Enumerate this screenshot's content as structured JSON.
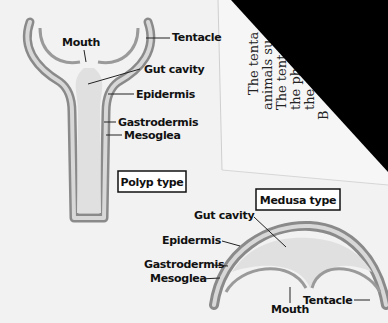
{
  "polyp": {
    "title": "Polyp type",
    "labels": {
      "mouth": "Mouth",
      "tentacle": "Tentacle",
      "gut_cavity": "Gut cavity",
      "epidermis": "Epidermis",
      "gastrodermis": "Gastrodermis",
      "mesoglea": "Mesoglea"
    }
  },
  "medusa": {
    "title": "Medusa type",
    "labels": {
      "gut_cavity": "Gut cavity",
      "epidermis": "Epidermis",
      "gastrodermis": "Gastrodermis",
      "mesoglea": "Mesoglea",
      "mouth": "Mouth",
      "tentacle": "Tentacle"
    }
  },
  "page_text": {
    "lines": [
      "The tenta",
      "animals su",
      "The tent",
      "the ph",
      "the",
      "B"
    ]
  },
  "colors": {
    "background": "#f2f2f2",
    "epidermis": "#9a9a9a",
    "gut": "#dcdcdc",
    "shadow": "#000000"
  }
}
